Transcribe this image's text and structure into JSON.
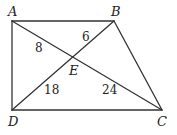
{
  "diagram": {
    "type": "quadrilateral-with-diagonals",
    "points": {
      "A": {
        "label": "A",
        "x": 12,
        "y": 21
      },
      "B": {
        "label": "B",
        "x": 114,
        "y": 21
      },
      "C": {
        "label": "C",
        "x": 162,
        "y": 110
      },
      "D": {
        "label": "D",
        "x": 12,
        "y": 110
      },
      "E": {
        "label": "E",
        "x": 72,
        "y": 58
      }
    },
    "segments": [
      "AB",
      "BC",
      "CD",
      "DA",
      "AC",
      "BD"
    ],
    "segment_lengths": {
      "AE": "8",
      "BE": "6",
      "DE": "18",
      "CE": "24"
    },
    "line_color": "#333333"
  }
}
